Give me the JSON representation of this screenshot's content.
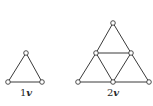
{
  "figures": [
    {
      "id": "1v",
      "label_number": "1",
      "label_var": "v",
      "label_pos": [
        26,
        96
      ],
      "vertices": [
        [
          26,
          53
        ],
        [
          8,
          82
        ],
        [
          42,
          82
        ]
      ],
      "edges": [
        [
          0,
          1
        ],
        [
          0,
          2
        ],
        [
          1,
          2
        ]
      ]
    },
    {
      "id": "2v",
      "label_number": "2",
      "label_var": "v",
      "label_pos": [
        113,
        96
      ],
      "vertices": [
        [
          113,
          23
        ],
        [
          96,
          53
        ],
        [
          131,
          53
        ],
        [
          78,
          82
        ],
        [
          113,
          82
        ],
        [
          149,
          82
        ]
      ],
      "edges": [
        [
          0,
          1
        ],
        [
          0,
          2
        ],
        [
          1,
          2
        ],
        [
          1,
          3
        ],
        [
          1,
          4
        ],
        [
          2,
          4
        ],
        [
          2,
          5
        ],
        [
          3,
          4
        ],
        [
          4,
          5
        ]
      ]
    }
  ],
  "colors": {
    "stroke": "#3a3a3a",
    "background": "#ffffff"
  }
}
